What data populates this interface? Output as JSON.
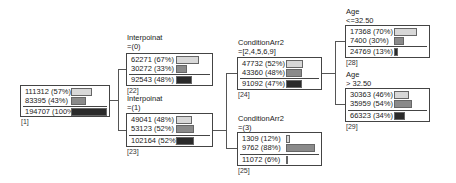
{
  "colors": {
    "class_a": "#d8d8d8",
    "class_b": "#8a8a8a",
    "total": "#2a2a2a",
    "border": "#444444"
  },
  "nodes": {
    "n1": {
      "id": "[1]",
      "split_var": "",
      "split_cond": "",
      "rows": [
        {
          "label": "111312 (57%)",
          "frac": 0.57
        },
        {
          "label": "83395 (43%)",
          "frac": 0.43
        }
      ],
      "total": {
        "label": "194707 (100%)",
        "frac": 1.0
      }
    },
    "n22": {
      "id": "[22]",
      "split_var": "Interpoinat",
      "split_cond": "=(0)",
      "rows": [
        {
          "label": "62271 (67%)",
          "frac": 0.67
        },
        {
          "label": "30272 (33%)",
          "frac": 0.33
        }
      ],
      "total": {
        "label": "92543 (48%)",
        "frac": 0.48
      }
    },
    "n23": {
      "id": "[23]",
      "split_var": "Interpoinat",
      "split_cond": "=(1)",
      "rows": [
        {
          "label": "49041 (48%)",
          "frac": 0.48
        },
        {
          "label": "53123 (52%)",
          "frac": 0.52
        }
      ],
      "total": {
        "label": "102164 (52%)",
        "frac": 0.52
      }
    },
    "n24": {
      "id": "[24]",
      "split_var": "ConditionArr2",
      "split_cond": "=[2,4,5,6,9]",
      "rows": [
        {
          "label": "47732 (52%)",
          "frac": 0.52
        },
        {
          "label": "43360 (48%)",
          "frac": 0.48
        }
      ],
      "total": {
        "label": "91092 (47%)",
        "frac": 0.47
      }
    },
    "n25": {
      "id": "[25]",
      "split_var": "ConditionArr2",
      "split_cond": "=(3)",
      "rows": [
        {
          "label": "1309 (12%)",
          "frac": 0.12
        },
        {
          "label": "9762 (88%)",
          "frac": 0.88
        }
      ],
      "total": {
        "label": "11072 (6%)",
        "frac": 0.06
      }
    },
    "n28": {
      "id": "[28]",
      "split_var": "Age",
      "split_cond": "<=32.50",
      "rows": [
        {
          "label": "17368 (70%)",
          "frac": 0.7
        },
        {
          "label": "7400 (30%)",
          "frac": 0.3
        }
      ],
      "total": {
        "label": "24769 (13%)",
        "frac": 0.13
      }
    },
    "n29": {
      "id": "[29]",
      "split_var": "Age",
      "split_cond": "> 32.50",
      "rows": [
        {
          "label": "30363 (46%)",
          "frac": 0.46
        },
        {
          "label": "35959 (54%)",
          "frac": 0.54
        }
      ],
      "total": {
        "label": "66323 (34%)",
        "frac": 0.34
      }
    }
  }
}
